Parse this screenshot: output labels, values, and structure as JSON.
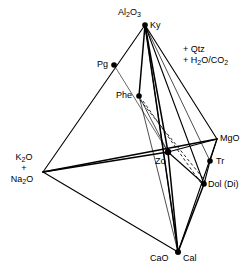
{
  "figure": {
    "type": "ternary-tetrahedron-phase-diagram",
    "background_color": "#ffffff",
    "line_color": "#000000",
    "marker_color": "#000000"
  },
  "conditions": {
    "line1": "+ Qtz",
    "line2_prefix": "+ H",
    "line2_sub1": "2",
    "line2_mid": "O/CO",
    "line2_sub2": "2"
  },
  "vertices": {
    "top": {
      "name": "Al2O3",
      "label_prefix": "Al",
      "label_sub1": "2",
      "label_mid": "O",
      "label_sub2": "3",
      "mineral": "Ky",
      "x": 145,
      "y": 25
    },
    "left": {
      "name": "K2O + Na2O",
      "l1_prefix": "K",
      "l1_sub": "2",
      "l1_suffix": "O",
      "l2": "+",
      "l3_prefix": "Na",
      "l3_sub": "2",
      "l3_suffix": "O",
      "x": 43,
      "y": 172
    },
    "right": {
      "name": "MgO",
      "label": "MgO",
      "x": 217,
      "y": 139
    },
    "bottom": {
      "name": "CaO",
      "label": "CaO",
      "mineral": "Cal",
      "x": 178,
      "y": 252
    }
  },
  "points": [
    {
      "id": "pg",
      "label": "Pg",
      "x": 114,
      "y": 65,
      "label_side": "left"
    },
    {
      "id": "phe",
      "label": "Phe",
      "x": 139,
      "y": 96,
      "label_side": "left"
    },
    {
      "id": "zo",
      "label": "Zo",
      "x": 168,
      "y": 152,
      "label_side": "left"
    },
    {
      "id": "tr",
      "label": "Tr",
      "x": 210,
      "y": 161,
      "label_side": "right"
    },
    {
      "id": "dol",
      "label": "Dol (Di)",
      "x": 204,
      "y": 184,
      "label_side": "right"
    }
  ],
  "edges": [
    {
      "id": "top-left",
      "from": "top",
      "to": "left",
      "style": "solid",
      "weight": 1.1
    },
    {
      "id": "top-right",
      "from": "top",
      "to": "right",
      "style": "solid",
      "weight": 1.1
    },
    {
      "id": "top-bottom",
      "from": "top",
      "to": "bottom",
      "style": "solid",
      "weight": 1.4
    },
    {
      "id": "left-right",
      "from": "left",
      "to": "right",
      "style": "solid",
      "weight": 1.4
    },
    {
      "id": "left-bottom",
      "from": "left",
      "to": "bottom",
      "style": "solid",
      "weight": 1.1
    },
    {
      "id": "right-bottom",
      "from": "right",
      "to": "bottom",
      "style": "solid",
      "weight": 1.1
    }
  ],
  "tielines_solid": [
    {
      "id": "ky-phe",
      "from": [
        145,
        25
      ],
      "to": [
        139,
        96
      ],
      "weight": 1.4
    },
    {
      "id": "ky-zo",
      "from": [
        145,
        25
      ],
      "to": [
        168,
        152
      ],
      "weight": 1.4
    },
    {
      "id": "ky-tr",
      "from": [
        145,
        25
      ],
      "to": [
        210,
        161
      ],
      "weight": 0.7
    },
    {
      "id": "ky-dol",
      "from": [
        145,
        25
      ],
      "to": [
        204,
        184
      ],
      "weight": 1.1
    },
    {
      "id": "ky-cal",
      "from": [
        145,
        25
      ],
      "to": [
        178,
        252
      ],
      "weight": 0.7
    },
    {
      "id": "phe-zo",
      "from": [
        139,
        96
      ],
      "to": [
        168,
        152
      ],
      "weight": 0.7
    },
    {
      "id": "phe-cal",
      "from": [
        139,
        96
      ],
      "to": [
        178,
        252
      ],
      "weight": 0.7
    },
    {
      "id": "zo-cal",
      "from": [
        168,
        152
      ],
      "to": [
        178,
        252
      ],
      "weight": 1.4
    },
    {
      "id": "zo-dol",
      "from": [
        168,
        152
      ],
      "to": [
        204,
        184
      ],
      "weight": 1.1
    },
    {
      "id": "dol-cal",
      "from": [
        204,
        184
      ],
      "to": [
        178,
        252
      ],
      "weight": 1.4
    },
    {
      "id": "zo-mgo",
      "from": [
        168,
        152
      ],
      "to": [
        217,
        139
      ],
      "weight": 1.1
    },
    {
      "id": "mgo-tr",
      "from": [
        217,
        139
      ],
      "to": [
        210,
        161
      ],
      "weight": 1.1
    },
    {
      "id": "tr-dol",
      "from": [
        210,
        161
      ],
      "to": [
        204,
        184
      ],
      "weight": 1.1
    },
    {
      "id": "pg-zo",
      "from": [
        114,
        65
      ],
      "to": [
        168,
        152
      ],
      "weight": 0.6
    },
    {
      "id": "left-zo",
      "from": [
        43,
        172
      ],
      "to": [
        168,
        152
      ],
      "weight": 1.4
    }
  ],
  "tielines_dashed": [
    {
      "id": "phe-dol-a",
      "from": [
        140,
        100
      ],
      "to": [
        206,
        182
      ],
      "weight": 0.8
    },
    {
      "id": "phe-dol-b",
      "from": [
        142,
        101
      ],
      "to": [
        203,
        186
      ],
      "weight": 0.8
    }
  ]
}
